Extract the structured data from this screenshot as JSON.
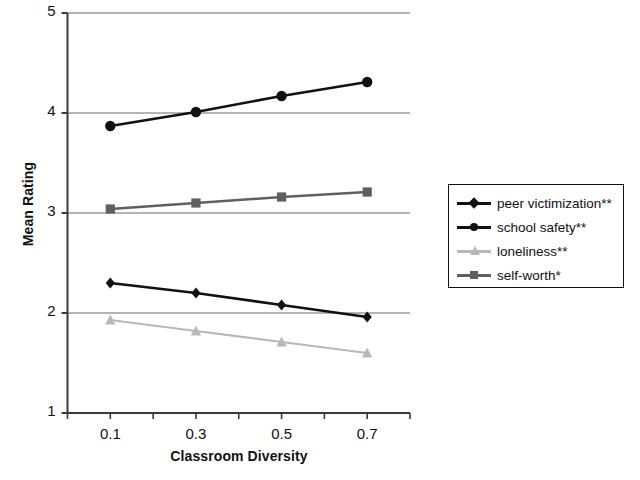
{
  "chart_data": {
    "type": "line",
    "title": "",
    "xlabel": "Classroom Diversity",
    "ylabel": "Mean Rating",
    "x": [
      0.1,
      0.3,
      0.5,
      0.7
    ],
    "categories": [
      "0.1",
      "0.3",
      "0.5",
      "0.7"
    ],
    "xtick_labels": [
      "0.1",
      "0.3",
      "0.5",
      "0.7"
    ],
    "ytick_labels": [
      "1",
      "2",
      "3",
      "4",
      "5"
    ],
    "ylim": [
      1,
      5
    ],
    "xlim": [
      0.0,
      0.8
    ],
    "grid": "horizontal",
    "legend_position": "right",
    "series": [
      {
        "name": "peer victimization**",
        "values": [
          2.3,
          2.2,
          2.08,
          1.96
        ],
        "marker": "diamond",
        "color": "#111111"
      },
      {
        "name": "school safety**",
        "values": [
          3.87,
          4.01,
          4.17,
          4.31
        ],
        "marker": "circle",
        "color": "#111111"
      },
      {
        "name": "loneliness**",
        "values": [
          1.93,
          1.82,
          1.71,
          1.6
        ],
        "marker": "triangle",
        "color": "#b8b8b8"
      },
      {
        "name": "self-worth*",
        "values": [
          3.04,
          3.1,
          3.16,
          3.21
        ],
        "marker": "square",
        "color": "#5f5f5f"
      }
    ]
  },
  "legend": {
    "items": [
      {
        "label": "peer victimization**",
        "marker": "diamond",
        "color": "#111111"
      },
      {
        "label": "school safety**",
        "marker": "circle",
        "color": "#111111"
      },
      {
        "label": "loneliness**",
        "marker": "triangle",
        "color": "#b8b8b8"
      },
      {
        "label": "self-worth*",
        "marker": "square",
        "color": "#5f5f5f"
      }
    ]
  },
  "colors": {
    "axis": "#3a3a3a",
    "grid": "#6b6b6b",
    "text": "#111111",
    "background": "#ffffff"
  }
}
